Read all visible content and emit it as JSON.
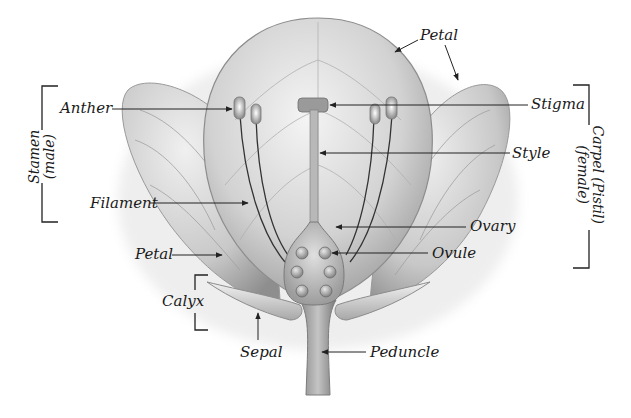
{
  "diagram": {
    "labels": {
      "petal_top": "Petal",
      "anther": "Anther",
      "stigma": "Stigma",
      "style": "Style",
      "filament": "Filament",
      "ovary": "Ovary",
      "petal_left": "Petal",
      "ovule": "Ovule",
      "calyx": "Calyx",
      "sepal": "Sepal",
      "peduncle": "Peduncle"
    },
    "groups": {
      "stamen": {
        "line1": "Stamen",
        "line2": "(male)"
      },
      "carpel": {
        "line1": "Carpel (Pistil)",
        "line2": "(female)"
      }
    },
    "ovule_count": 6
  }
}
